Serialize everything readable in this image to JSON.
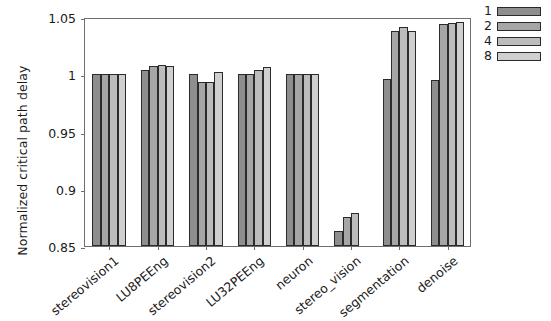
{
  "chart_data": {
    "type": "bar",
    "title": "",
    "subtitle": "",
    "xlabel": "",
    "ylabel": "Normalized critical path delay",
    "ylim": [
      0.85,
      1.05
    ],
    "yticks": [
      0.85,
      0.9,
      0.95,
      1,
      1.05
    ],
    "ytick_labels": [
      "0.85",
      "0.9",
      "0.95",
      "1",
      "1.05"
    ],
    "grid": false,
    "legend_position": "upper right",
    "legend_title": "",
    "categories": [
      "stereovision1",
      "LU8PEEng",
      "stereovision2",
      "LU32PEEng",
      "neuron",
      "stereo_vision",
      "segmentation",
      "denoise"
    ],
    "series": [
      {
        "name": "1",
        "color": "#8e8e8e",
        "values": [
          1.0,
          1.004,
          1.0,
          1.0,
          1.0,
          0.863,
          0.996,
          0.995
        ]
      },
      {
        "name": "2",
        "color": "#a6a6a6",
        "values": [
          1.0,
          1.007,
          0.993,
          1.0,
          1.0,
          0.875,
          1.038,
          1.044
        ]
      },
      {
        "name": "4",
        "color": "#bcbcbc",
        "values": [
          1.0,
          1.008,
          0.993,
          1.004,
          1.0,
          0.879,
          1.041,
          1.045
        ]
      },
      {
        "name": "8",
        "color": "#cfcfcf",
        "values": [
          1.0,
          1.007,
          1.002,
          1.006,
          1.0,
          null,
          1.038,
          1.046
        ]
      }
    ]
  },
  "axis": {
    "frame_color": "#6e6e6e",
    "text_color": "#1a1a1a",
    "bar_edge_color": "#2b2b2b"
  }
}
